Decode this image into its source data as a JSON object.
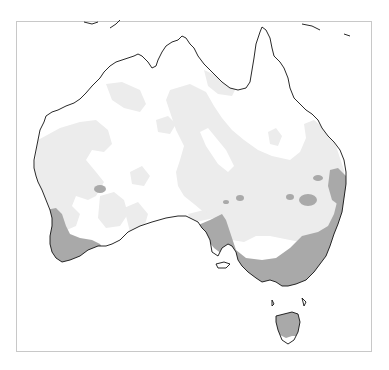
{
  "map": {
    "title": "Australia shaded region map",
    "region": "Australia",
    "colors": {
      "background": "#ffffff",
      "frame": "#c8c8c8",
      "land": "#ffffff",
      "light_zone": "#ececec",
      "dark_zone": "#a9a9a9",
      "coastline": "#111111"
    },
    "legend": [
      {
        "label": "unshaded",
        "color": "#ffffff"
      },
      {
        "label": "light shading",
        "color": "#ececec"
      },
      {
        "label": "dark shading",
        "color": "#a9a9a9"
      }
    ],
    "features": {
      "mainland": "Australian mainland",
      "island": "Tasmania"
    }
  }
}
